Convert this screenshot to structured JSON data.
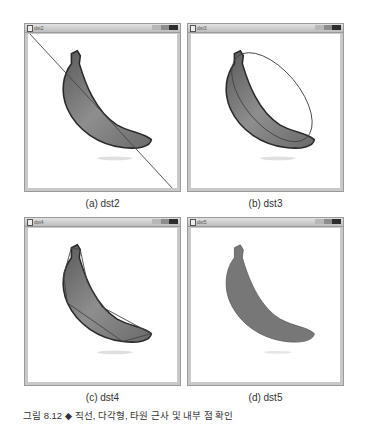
{
  "figure": {
    "caption": "그림 8.12 ◆ 직선, 다각형, 타원 근사 및 내부 점 확인",
    "panels": [
      {
        "window_title": "dst2",
        "label": "(a) dst2",
        "overlay": "line"
      },
      {
        "window_title": "dst3",
        "label": "(b) dst3",
        "overlay": "ellipse"
      },
      {
        "window_title": "dst4",
        "label": "(c) dst4",
        "overlay": "polygon"
      },
      {
        "window_title": "dst5",
        "label": "(d) dst5",
        "overlay": "filled"
      }
    ]
  },
  "icons": {
    "window": "window-app-icon",
    "minimize": "minimize-icon",
    "maximize": "maximize-icon",
    "close": "close-icon"
  },
  "colors": {
    "banana_fill": "#7a7a7a",
    "banana_outline": "#2a2a2a",
    "overlay_line": "#444444",
    "frame": "#c9c9c9"
  }
}
